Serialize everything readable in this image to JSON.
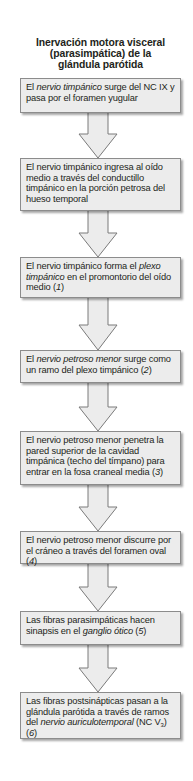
{
  "title": {
    "line1": "Inervación motora visceral",
    "line2": "(parasimpática) de la",
    "line3": "glándula parótida"
  },
  "colors": {
    "box_fill": "#ececec",
    "box_border": "#8c8c8c",
    "arrow_fill": "#ececec",
    "arrow_stroke": "#7a7a7a",
    "text": "#231f20"
  },
  "steps": [
    {
      "p1": "El ",
      "i1": "nervio timpánico",
      "p2": " surge del NC IX y pasa por el foramen yugular"
    },
    {
      "p1": "El nervio timpánico ingresa al oído medio a través del conductillo timpánico en la porción petrosa del hueso temporal"
    },
    {
      "p1": "El nervio timpánico forma el ",
      "i1": "plexo timpánico",
      "p2": " en el promontorio del oído medio (",
      "i2": "1",
      "p3": ")"
    },
    {
      "p1": "El ",
      "i1": "nervio petroso menor",
      "p2": " surge como un ramo del plexo timpánico (",
      "i2": "2",
      "p3": ")"
    },
    {
      "p1": "El nervio petroso menor penetra la pared superior de la cavidad timpánica (techo del tímpano) para entrar en la fosa craneal media (",
      "i1": "3",
      "p2": ")"
    },
    {
      "p1": "El nervio petroso menor discurre por el cráneo a través del foramen oval (",
      "i1": "4",
      "p2": ")"
    },
    {
      "p1": "Las fibras parasimpáticas hacen sinapsis en el ",
      "i1": "ganglio ótico",
      "p2": " (",
      "i2": "5",
      "p3": ")"
    },
    {
      "p1": "Las fibras postsinápticas pasan a la glándula parótida a través de ramos del ",
      "i1": "nervio auriculotemporal",
      "p2": " (NC V",
      "sub": "3",
      "p3": ") (",
      "i2": "6",
      "p4": ")"
    }
  ],
  "arrows": [
    {
      "from": 1,
      "to": 2
    },
    {
      "from": 2,
      "to": 3
    },
    {
      "from": 3,
      "to": 4
    },
    {
      "from": 4,
      "to": 5
    },
    {
      "from": 5,
      "to": 6
    },
    {
      "from": 6,
      "to": 7
    },
    {
      "from": 7,
      "to": 8
    }
  ]
}
